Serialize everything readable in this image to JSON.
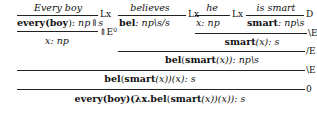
{
  "derivation": {
    "leaves": {
      "every_boy": "Every boy",
      "believes": "believes",
      "he": "he",
      "is_smart": "is smart"
    },
    "rule_labels": {
      "r1": "Lx",
      "r2": "Lx",
      "r3": "Lx",
      "r4": "D",
      "r5": "⇑E",
      "r5_sup": "0",
      "r6": "\\E",
      "r7": "/E",
      "r8": "\\E",
      "r9": "0"
    },
    "formulas": {
      "every_boy_term_a": "every",
      "every_boy_term_b": "(",
      "every_boy_term_c": "boy",
      "every_boy_term_d": "): ",
      "every_boy_type": "np⇑s",
      "bel_term": "bel",
      "bel_type": ": np\\s/s",
      "he_type": "x: np",
      "smart_term": "smart",
      "smart_type": ": np\\s",
      "hyp_x": "x: np",
      "smart_x_term": "smart",
      "smart_x_rest": "(x): s",
      "bel_smart_a": "bel",
      "bel_smart_b": "(",
      "bel_smart_c": "smart",
      "bel_smart_d": "(x)): np\\s",
      "bel_app_a": "bel",
      "bel_app_b": "(",
      "bel_app_c": "smart",
      "bel_app_d": "(x))(x): s",
      "final_a": "every",
      "final_b": "(",
      "final_c": "boy",
      "final_d": ")(λx.",
      "final_e": "bel",
      "final_f": "(",
      "final_g": "smart",
      "final_h": "(x))(x)): s"
    }
  }
}
